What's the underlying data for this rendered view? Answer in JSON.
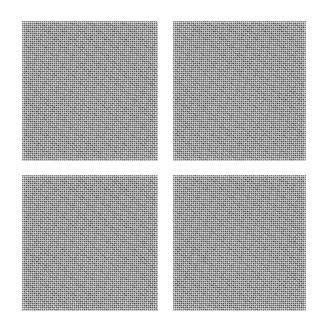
{
  "figure": {
    "kind": "texture-patch-grid",
    "background_color": "#ffffff",
    "canvas": {
      "width": 326,
      "height": 322
    },
    "grid": {
      "rows": 2,
      "columns": 2,
      "count": 4
    },
    "patch_fill_color": "#8b8b8b",
    "patch_texture": "fine-halftone-dither-noise",
    "caption": "",
    "title": "",
    "patches": [
      {
        "id": "patch-top-left",
        "label": "",
        "position": "top-left",
        "row": 1,
        "column": 1,
        "x": 22,
        "y": 21,
        "width": 136,
        "height": 140,
        "fill_color": "#8b8b8b",
        "texture": "fine-halftone-dither-noise"
      },
      {
        "id": "patch-top-right",
        "label": "",
        "position": "top-right",
        "row": 1,
        "column": 2,
        "x": 173,
        "y": 21,
        "width": 133,
        "height": 140,
        "fill_color": "#8b8b8b",
        "texture": "fine-halftone-dither-noise"
      },
      {
        "id": "patch-bottom-left",
        "label": "",
        "position": "bottom-left",
        "row": 2,
        "column": 1,
        "x": 22,
        "y": 175,
        "width": 136,
        "height": 136,
        "fill_color": "#8b8b8b",
        "texture": "fine-halftone-dither-noise"
      },
      {
        "id": "patch-bottom-right",
        "label": "",
        "position": "bottom-right",
        "row": 2,
        "column": 2,
        "x": 173,
        "y": 175,
        "width": 133,
        "height": 136,
        "fill_color": "#8b8b8b",
        "texture": "fine-halftone-dither-noise"
      }
    ]
  }
}
